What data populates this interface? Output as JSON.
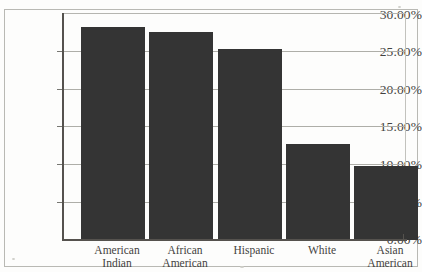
{
  "chart_data": {
    "type": "bar",
    "title": "",
    "subtitle": "",
    "xlabel": "",
    "ylabel": "",
    "categories": [
      "American Indian",
      "African American",
      "Hispanic",
      "White",
      "Asian American"
    ],
    "category_lines": [
      [
        "American",
        "Indian"
      ],
      [
        "African",
        "American"
      ],
      [
        "Hispanic",
        ""
      ],
      [
        "White",
        ""
      ],
      [
        "Asian",
        "American"
      ]
    ],
    "values": [
      28.3,
      27.6,
      25.3,
      12.7,
      9.8
    ],
    "value_labels": [
      "28.30%",
      "27.60%",
      "25.30%",
      "12.70%",
      "9.80%"
    ],
    "ylim": [
      0,
      30
    ],
    "ytick_values": [
      30,
      25,
      20,
      15,
      10,
      5,
      0
    ],
    "ytick_labels": [
      "30.00%",
      "25.00%",
      "20.00%",
      "15.00%",
      "10.00%",
      "5.00%",
      "0.00%"
    ],
    "grid": true,
    "grid_axis": "y",
    "legend": false,
    "legend_position": "none",
    "bar_color": "#343434",
    "gridline_color": "#aeaea8",
    "axis_color": "#55524e",
    "background_color": "#ffffff",
    "frame": true
  }
}
